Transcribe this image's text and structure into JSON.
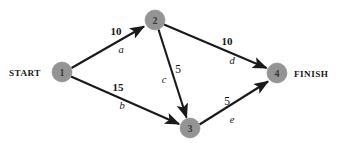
{
  "diagram": {
    "background_color": "#ffffff",
    "node_color": "#949494",
    "edge_color": "#1a1a1a",
    "terminals": {
      "start_label": "START",
      "finish_label": "FINISH"
    },
    "nodes": [
      {
        "id": "1",
        "label": "1",
        "cx": 62,
        "cy": 72,
        "r": 10
      },
      {
        "id": "2",
        "label": "2",
        "cx": 155,
        "cy": 20,
        "r": 10
      },
      {
        "id": "3",
        "label": "3",
        "cx": 190,
        "cy": 128,
        "r": 10
      },
      {
        "id": "4",
        "label": "4",
        "cx": 277,
        "cy": 73,
        "r": 10
      }
    ],
    "edges": [
      {
        "id": "a",
        "from": "1",
        "to": "2",
        "activity": "a",
        "weight": "10",
        "weight_style": "bold",
        "weight_x": 116,
        "weight_y": 31,
        "activity_x": 121,
        "activity_y": 49
      },
      {
        "id": "b",
        "from": "1",
        "to": "3",
        "activity": "b",
        "weight": "15",
        "weight_style": "bold",
        "weight_x": 118,
        "weight_y": 87,
        "activity_x": 122,
        "activity_y": 105
      },
      {
        "id": "c",
        "from": "2",
        "to": "3",
        "activity": "c",
        "weight": "5",
        "weight_style": "light",
        "weight_x": 178,
        "weight_y": 69,
        "activity_x": 164,
        "activity_y": 79
      },
      {
        "id": "d",
        "from": "2",
        "to": "4",
        "activity": "d",
        "weight": "10",
        "weight_style": "bold",
        "weight_x": 227,
        "weight_y": 41,
        "activity_x": 232,
        "activity_y": 60
      },
      {
        "id": "e",
        "from": "3",
        "to": "4",
        "activity": "e",
        "weight": "5",
        "weight_style": "light",
        "weight_x": 227,
        "weight_y": 101,
        "activity_x": 232,
        "activity_y": 119
      }
    ]
  }
}
